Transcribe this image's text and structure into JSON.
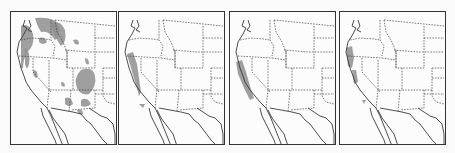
{
  "figure": {
    "panels": [
      {
        "id": "panel-1",
        "left": 10,
        "extent": "widespread",
        "shade_color": "#8e8e8e"
      },
      {
        "id": "panel-2",
        "left": 118,
        "extent": "northern California coastal / Sierra strip",
        "shade_color": "#8e8e8e"
      },
      {
        "id": "panel-3",
        "left": 229,
        "extent": "California Sierra Nevada / coastal strip",
        "shade_color": "#8e8e8e"
      },
      {
        "id": "panel-4",
        "left": 339,
        "extent": "northern California / southern Oregon coast",
        "shade_color": "#8e8e8e"
      }
    ],
    "line_color": "#3a3a3a",
    "background_color": "#fafafa"
  }
}
